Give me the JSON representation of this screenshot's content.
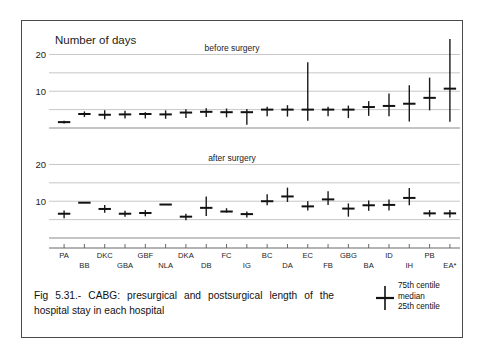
{
  "figure": {
    "caption": "Fig 5.31.- CABG: presurgical and postsurgical length of the hospital stay in each hospital",
    "axis_title": "Number of days",
    "panel_top_label": "before surgery",
    "panel_bottom_label": "after surgery"
  },
  "legend": {
    "glyph_name": "whisker-marker",
    "line1": "75th centile",
    "line2": "median",
    "line3": "25th centile"
  },
  "chart_data": {
    "type": "line",
    "chart_kind": "centile-whisker",
    "title": "Fig 5.31.- CABG: presurgical and postsurgical length of the hospital stay in each hospital",
    "xlabel": "",
    "ylabel": "Number of days",
    "grid": true,
    "legend_position": "bottom-right",
    "categories": [
      "PA",
      "BB",
      "DKC",
      "GBA",
      "GBF",
      "NLA",
      "DKA",
      "DB",
      "FC",
      "IG",
      "BC",
      "DA",
      "EC",
      "FB",
      "GBG",
      "BA",
      "ID",
      "IH",
      "PB",
      "EA*"
    ],
    "panels": [
      {
        "name": "before surgery",
        "ylim": [
          0,
          22
        ],
        "yticks": [
          10,
          20
        ],
        "gridlines": [
          5,
          10,
          15,
          20
        ],
        "series": [
          {
            "name": "25th centile",
            "values": [
              1.2,
              3.0,
              2.4,
              2.6,
              2.6,
              2.5,
              2.7,
              3.0,
              2.9,
              0.9,
              3.2,
              3.1,
              2.0,
              3.2,
              2.7,
              3.3,
              3.2,
              1.8,
              4.8,
              1.7
            ]
          },
          {
            "name": "median",
            "values": [
              1.6,
              3.8,
              3.6,
              3.7,
              3.8,
              3.7,
              4.2,
              4.4,
              4.3,
              4.3,
              5.0,
              5.0,
              5.0,
              5.0,
              5.0,
              5.7,
              6.0,
              6.6,
              8.2,
              10.7
            ]
          },
          {
            "name": "75th centile",
            "values": [
              2.0,
              4.5,
              4.8,
              4.7,
              4.3,
              4.8,
              5.1,
              5.4,
              5.3,
              5.2,
              5.8,
              6.2,
              17.9,
              5.8,
              6.1,
              7.3,
              9.4,
              11.6,
              13.7,
              24.2
            ]
          }
        ]
      },
      {
        "name": "after surgery",
        "ylim": [
          0,
          22
        ],
        "yticks": [
          10,
          20
        ],
        "gridlines": [
          5,
          10,
          15,
          20
        ],
        "series": [
          {
            "name": "25th centile",
            "values": [
              5.4,
              9.6,
              6.9,
              5.8,
              5.9,
              9.1,
              4.8,
              6.0,
              6.9,
              5.6,
              8.9,
              9.8,
              7.5,
              9.0,
              5.8,
              7.4,
              7.5,
              8.9,
              5.8,
              5.6
            ]
          },
          {
            "name": "median",
            "values": [
              6.6,
              9.6,
              7.9,
              6.6,
              6.8,
              9.1,
              5.8,
              8.2,
              7.2,
              6.5,
              10.0,
              11.3,
              8.6,
              10.5,
              8.0,
              8.9,
              9.0,
              10.9,
              6.7,
              6.7
            ]
          },
          {
            "name": "75th centile",
            "values": [
              7.5,
              9.6,
              9.0,
              7.4,
              7.6,
              9.1,
              6.6,
              11.3,
              8.1,
              7.2,
              11.9,
              13.7,
              10.0,
              12.7,
              9.4,
              10.2,
              10.5,
              13.6,
              7.6,
              7.6
            ]
          }
        ]
      }
    ]
  }
}
